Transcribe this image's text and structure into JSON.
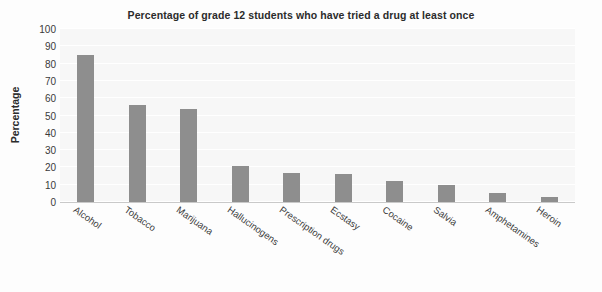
{
  "chart_data": {
    "type": "bar",
    "title": "Percentage of grade 12 students who have tried a drug at least once",
    "xlabel": "",
    "ylabel": "Percentage",
    "categories": [
      "Alcohol",
      "Tobacco",
      "Marijuana",
      "Hallucinogens",
      "Prescription drugs",
      "Ecstasy",
      "Cocaine",
      "Salvia",
      "Amphetamines",
      "Heroin"
    ],
    "values": [
      85,
      56,
      54,
      21,
      17,
      16,
      12,
      10,
      5,
      3
    ],
    "ylim": [
      0,
      100
    ],
    "yticks": [
      0,
      10,
      20,
      30,
      40,
      50,
      60,
      70,
      80,
      90,
      100
    ],
    "ytick_labels": [
      "0",
      "10",
      "20",
      "30",
      "40",
      "50",
      "60",
      "70",
      "80",
      "90",
      "100"
    ],
    "grid": true,
    "legend": false,
    "bar_color": "#8e8e8e",
    "plot_background": "#f7f7f7",
    "gridline_color": "#ffffff",
    "text_color": "#2b2b2b"
  }
}
